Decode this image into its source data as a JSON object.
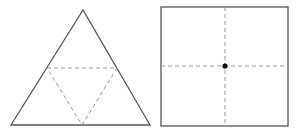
{
  "diagram": {
    "colors": {
      "outline": "#555555",
      "dashed": "#9a9a9a",
      "dot": "#111111",
      "background": "#ffffff"
    },
    "triangle": {
      "outer": {
        "apex": [
          83,
          10
        ],
        "bottom_left": [
          11,
          125
        ],
        "bottom_right": [
          150,
          125
        ]
      },
      "inner_dashed": {
        "left_mid": [
          47,
          68
        ],
        "right_mid": [
          117,
          68
        ],
        "bottom_mid": [
          82,
          125
        ]
      }
    },
    "square": {
      "x": 161,
      "y": 7,
      "width": 127,
      "height": 119,
      "dashed_vertical_x": 225,
      "dashed_horizontal_y": 66,
      "center_dot": [
        225,
        66
      ]
    }
  }
}
